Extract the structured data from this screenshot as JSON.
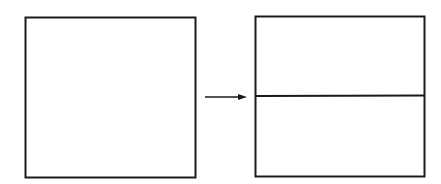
{
  "diagram": {
    "stroke_color": "#1a1a1a",
    "background": "#ffffff",
    "shapes": [
      {
        "id": "left-square",
        "type": "rect",
        "x": 25,
        "y": 17,
        "width": 170,
        "height": 161
      },
      {
        "id": "arrow",
        "type": "arrow",
        "x1": 205,
        "y1": 97,
        "x2": 246,
        "y2": 97,
        "direction": "right"
      },
      {
        "id": "right-square",
        "type": "rect",
        "x": 255,
        "y": 16,
        "width": 169,
        "height": 160
      },
      {
        "id": "divider",
        "type": "line",
        "x1": 255,
        "y1": 96,
        "x2": 424,
        "y2": 95
      }
    ]
  }
}
